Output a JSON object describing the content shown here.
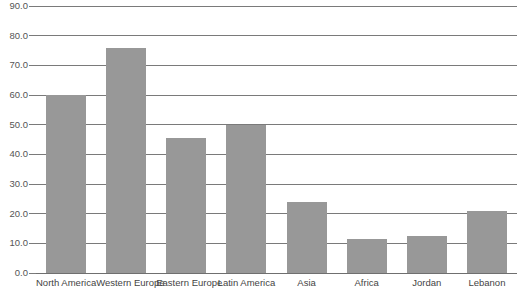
{
  "chart_data": {
    "type": "bar",
    "title": "",
    "xlabel": "",
    "ylabel": "",
    "ylim": [
      0,
      90
    ],
    "ytick_step": 10,
    "grid": true,
    "legend": false,
    "bar_color": "#989898",
    "categories": [
      "North America",
      "Western Europe",
      "Eastern Europe",
      "Latin America",
      "Asia",
      "Africa",
      "Jordan",
      "Lebanon"
    ],
    "values": [
      60.0,
      76.0,
      45.5,
      50.0,
      24.0,
      11.5,
      12.5,
      21.0
    ],
    "ytick_labels": [
      "90.0",
      "80.0",
      "70.0",
      "60.0",
      "50.0",
      "40.0",
      "30.0",
      "20.0",
      "10.0",
      "0.0"
    ],
    "ytick_values": [
      90,
      80,
      70,
      60,
      50,
      40,
      30,
      20,
      10,
      0
    ]
  }
}
